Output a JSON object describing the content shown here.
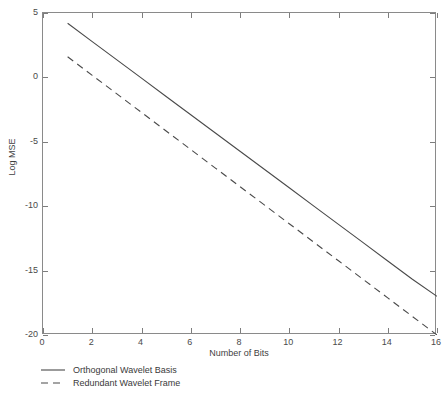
{
  "chart_data": {
    "type": "line",
    "title": "",
    "xlabel": "Number of Bits",
    "ylabel": "Log MSE",
    "xlim": [
      0,
      16
    ],
    "ylim": [
      -20,
      5
    ],
    "xticks": [
      0,
      2,
      4,
      6,
      8,
      10,
      12,
      14,
      16
    ],
    "xtick_labels": [
      "0",
      "2",
      "4",
      "6",
      "8",
      "10",
      "12",
      "14",
      "16"
    ],
    "yticks": [
      5,
      0,
      -5,
      -10,
      -15,
      -20
    ],
    "ytick_labels": [
      "5",
      "0",
      "-5",
      "-10",
      "-15",
      "-20"
    ],
    "grid": false,
    "legend_position": "below-left",
    "series": [
      {
        "name": "Orthogonal Wavelet Basis",
        "style": "solid",
        "color": "#4a4a4a",
        "x": [
          1,
          2,
          3,
          4,
          5,
          6,
          7,
          8,
          9,
          10,
          11,
          12,
          13,
          14,
          15,
          16
        ],
        "values": [
          4.2,
          2.78,
          1.36,
          -0.06,
          -1.48,
          -2.9,
          -4.32,
          -5.73,
          -7.15,
          -8.57,
          -9.99,
          -11.41,
          -12.83,
          -14.25,
          -15.67,
          -17.0
        ]
      },
      {
        "name": "Redundant Wavelet Frame",
        "style": "dashed",
        "color": "#4a4a4a",
        "x": [
          1,
          2,
          3,
          4,
          5,
          6,
          7,
          8,
          9,
          10,
          11,
          12,
          13,
          14,
          15,
          16
        ],
        "values": [
          1.6,
          0.16,
          -1.28,
          -2.72,
          -4.16,
          -5.6,
          -7.04,
          -8.48,
          -9.92,
          -11.36,
          -12.8,
          -14.24,
          -15.68,
          -17.12,
          -18.56,
          -20.0
        ]
      }
    ]
  },
  "legend": {
    "items": [
      {
        "label": "Orthogonal Wavelet Basis",
        "style": "solid"
      },
      {
        "label": "Redundant Wavelet Frame",
        "style": "dashed"
      }
    ]
  },
  "axes": {
    "x_label": "Number of Bits",
    "y_label": "Log MSE"
  },
  "colors": {
    "axis": "#8a8a8a",
    "tick": "#7d7d7d",
    "text": "#3a3a3a",
    "series": "#4a4a4a",
    "background": "#ffffff"
  }
}
